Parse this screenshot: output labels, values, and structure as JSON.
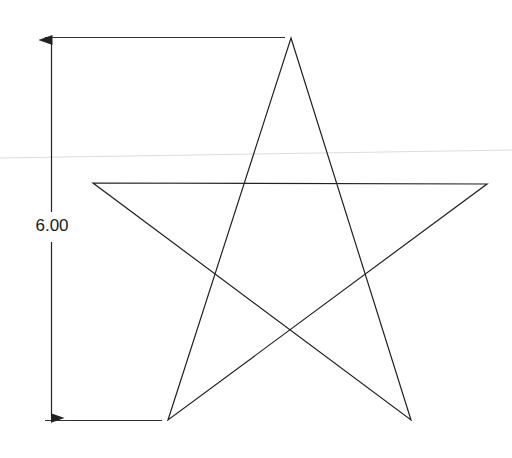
{
  "diagram": {
    "title": "",
    "shape": "five-pointed star",
    "dimension": {
      "label": "6.00",
      "orientation": "vertical",
      "from": "star apex",
      "to": "star bottom vertices"
    },
    "colors": {
      "stroke": "#222222",
      "faint_line": "#dcdcdc",
      "background": "#ffffff"
    },
    "star_vertices": [
      {
        "name": "apex",
        "x": 291,
        "y": 38
      },
      {
        "name": "right",
        "x": 487,
        "y": 184
      },
      {
        "name": "bottom-right",
        "x": 411,
        "y": 420
      },
      {
        "name": "bottom-left",
        "x": 168,
        "y": 420
      },
      {
        "name": "left",
        "x": 93,
        "y": 183
      }
    ]
  }
}
